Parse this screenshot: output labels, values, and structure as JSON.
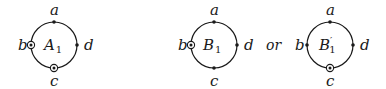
{
  "diagrams": [
    {
      "name": "A",
      "label": "A",
      "subscript": "1",
      "prime": "",
      "cx": 54,
      "cy": 45,
      "r": 23,
      "points": {
        "a": {
          "label": "a",
          "marker": "dot"
        },
        "b": {
          "label": "b",
          "marker": "circled-dot"
        },
        "c": {
          "label": "c",
          "marker": "circled-dot"
        },
        "d": {
          "label": "d",
          "marker": "dot"
        }
      }
    },
    {
      "name": "B",
      "label": "B",
      "subscript": "1",
      "prime": "",
      "cx": 214,
      "cy": 45,
      "r": 23,
      "points": {
        "a": {
          "label": "a",
          "marker": "dot"
        },
        "b": {
          "label": "b",
          "marker": "circled-dot"
        },
        "c": {
          "label": "c",
          "marker": "dot"
        },
        "d": {
          "label": "d",
          "marker": "dot"
        }
      }
    },
    {
      "name": "B-prime",
      "label": "B",
      "subscript": "1",
      "prime": "′",
      "cx": 330,
      "cy": 45,
      "r": 23,
      "points": {
        "a": {
          "label": "a",
          "marker": "dot"
        },
        "b": {
          "label": "b",
          "marker": "dot"
        },
        "c": {
          "label": "c",
          "marker": "circled-dot"
        },
        "d": {
          "label": "d",
          "marker": "dot"
        }
      }
    }
  ],
  "connector": {
    "label": "or"
  },
  "colors": {
    "stroke": "#1a1a1a",
    "background": "#ffffff"
  }
}
